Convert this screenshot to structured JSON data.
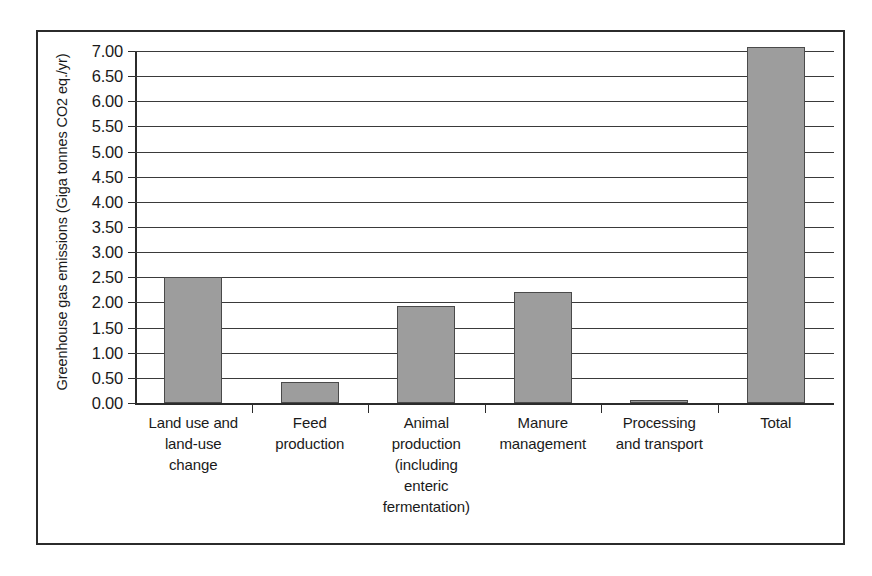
{
  "chart_data": {
    "type": "bar",
    "title": "",
    "xlabel": "",
    "ylabel": "Greenhouse gas emissions (Giga tonnes CO2 eq./yr)",
    "categories": [
      "Land use and land-use change",
      "Feed production",
      "Animal production (including enteric fermentation)",
      "Manure management",
      "Processing and transport",
      "Total"
    ],
    "category_lines": [
      [
        "Land use and",
        "land-use",
        "change"
      ],
      [
        "Feed",
        "production"
      ],
      [
        "Animal",
        "production",
        "(including",
        "enteric",
        "fermentation)"
      ],
      [
        "Manure",
        "management"
      ],
      [
        "Processing",
        "and transport"
      ],
      [
        "Total"
      ]
    ],
    "values": [
      2.5,
      0.42,
      1.93,
      2.2,
      0.03,
      7.08
    ],
    "ylim": [
      0.0,
      7.0
    ],
    "ytick_step": 0.5,
    "ytick_labels": [
      "7.00",
      "6.50",
      "6.00",
      "5.50",
      "5.00",
      "4.50",
      "4.00",
      "3.50",
      "3.00",
      "2.50",
      "2.00",
      "1.50",
      "1.00",
      "0.50",
      "0.00"
    ],
    "ytick_values": [
      7.0,
      6.5,
      6.0,
      5.5,
      5.0,
      4.5,
      4.0,
      3.5,
      3.0,
      2.5,
      2.0,
      1.5,
      1.0,
      0.5,
      0.0
    ],
    "grid": true,
    "legend": "none",
    "bar_color": "#9d9d9d",
    "bar_border_color": "#4a4a4a",
    "axis_color": "#2b2b2b",
    "grid_color": "#3a3a3a"
  }
}
